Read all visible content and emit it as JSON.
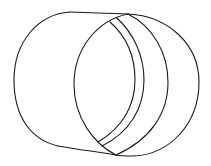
{
  "figure": {
    "type": "line-drawing",
    "background": "#ffffff",
    "stroke_color": "#1a1a1a",
    "parts": [
      {
        "name": "back-outline-left-arc"
      },
      {
        "name": "top-edge-line"
      },
      {
        "name": "bottom-edge-line"
      },
      {
        "name": "front-ellipse"
      },
      {
        "name": "inner-ring-arc-1"
      },
      {
        "name": "inner-ring-arc-2"
      },
      {
        "name": "outer-right-arc"
      }
    ]
  }
}
